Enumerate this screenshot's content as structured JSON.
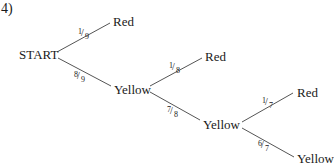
{
  "problem_number": "4)",
  "nodes": {
    "start": "START",
    "level1_red": "Red",
    "level1_yellow": "Yellow",
    "level2_red": "Red",
    "level2_yellow": "Yellow",
    "level3_red": "Red",
    "level3_yellow": "Yellow"
  },
  "branches": [
    {
      "from": "START",
      "to": "Red",
      "num": "1",
      "den": "9"
    },
    {
      "from": "START",
      "to": "Yellow",
      "num": "8",
      "den": "9"
    },
    {
      "from": "Yellow",
      "to": "Red",
      "num": "1",
      "den": "8"
    },
    {
      "from": "Yellow",
      "to": "Yellow",
      "num": "7",
      "den": "8"
    },
    {
      "from": "Yellow",
      "to": "Red",
      "num": "1",
      "den": "7"
    },
    {
      "from": "Yellow",
      "to": "Yellow",
      "num": "6",
      "den": "7"
    }
  ],
  "colors": {
    "line": "#555555",
    "text": "#1a1a1a"
  }
}
